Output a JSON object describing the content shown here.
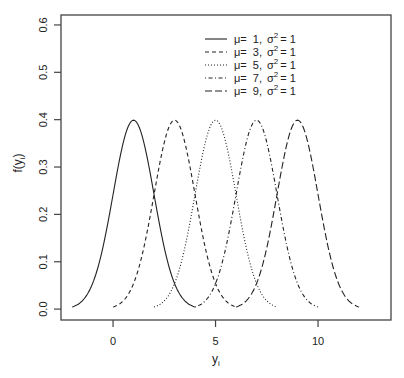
{
  "chart_data": {
    "type": "line",
    "title": "",
    "xlabel": "y",
    "xlabel_subscript": "i",
    "ylabel": "f(y",
    "ylabel_subscript": "i",
    "ylabel_close": ")",
    "xlim": [
      -2.54,
      13.56
    ],
    "ylim": [
      -0.023,
      0.621
    ],
    "x_ticks": [
      0,
      5,
      10
    ],
    "x_tick_labels": [
      "0",
      "5",
      "10"
    ],
    "y_ticks": [
      0.0,
      0.1,
      0.2,
      0.3,
      0.4,
      0.5,
      0.6
    ],
    "y_tick_labels": [
      "0.0",
      "0.1",
      "0.2",
      "0.3",
      "0.4",
      "0.5",
      "0.6"
    ],
    "grid": false,
    "legend_position": "top-center",
    "series": [
      {
        "name": "μ= 1, σ² = 1",
        "mu": 1,
        "sigma2": 1,
        "x_range": [
          -2,
          4
        ],
        "peak": 0.399,
        "line_style": "solid"
      },
      {
        "name": "μ= 3, σ² = 1",
        "mu": 3,
        "sigma2": 1,
        "x_range": [
          0,
          6
        ],
        "peak": 0.399,
        "line_style": "dashed"
      },
      {
        "name": "μ= 5, σ² = 1",
        "mu": 5,
        "sigma2": 1,
        "x_range": [
          2,
          8
        ],
        "peak": 0.399,
        "line_style": "dotted"
      },
      {
        "name": "μ= 7, σ² = 1",
        "mu": 7,
        "sigma2": 1,
        "x_range": [
          4,
          10
        ],
        "peak": 0.399,
        "line_style": "dotdash"
      },
      {
        "name": "μ= 9, σ² = 1",
        "mu": 9,
        "sigma2": 1,
        "x_range": [
          6,
          12
        ],
        "peak": 0.399,
        "line_style": "longdash"
      }
    ]
  },
  "legend": {
    "entries": [
      {
        "mu_label": "μ=",
        "mu": "1,",
        "sigma_label": "σ",
        "sup": "2",
        "eq": "= 1"
      },
      {
        "mu_label": "μ=",
        "mu": "3,",
        "sigma_label": "σ",
        "sup": "2",
        "eq": "= 1"
      },
      {
        "mu_label": "μ=",
        "mu": "5,",
        "sigma_label": "σ",
        "sup": "2",
        "eq": "= 1"
      },
      {
        "mu_label": "μ=",
        "mu": "7,",
        "sigma_label": "σ",
        "sup": "2",
        "eq": "= 1"
      },
      {
        "mu_label": "μ=",
        "mu": "9,",
        "sigma_label": "σ",
        "sup": "2",
        "eq": "= 1"
      }
    ]
  },
  "colors": {
    "line": "#222222",
    "axis": "#444444",
    "background": "#ffffff"
  }
}
